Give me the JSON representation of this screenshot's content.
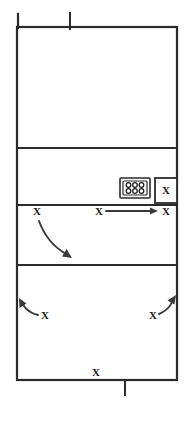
{
  "diagram": {
    "surface_color": "#ffffff",
    "line_color": "#2b2b2b",
    "arrow_color": "#3a3a3a",
    "player_marker_color": "#1a1a1a",
    "player_marker_symbol": "X",
    "net_post_top_label": "",
    "net_post_bottom_label": ""
  },
  "court": {
    "outer_boundary": {
      "x": 17,
      "y": 27,
      "width": 160,
      "height": 353
    },
    "zone_divider_lines_y": [
      148,
      205,
      265
    ],
    "zones": [
      {
        "name": "far-zone",
        "top": 27,
        "bottom": 148
      },
      {
        "name": "front-zone",
        "top": 148,
        "bottom": 205
      },
      {
        "name": "attack-zone",
        "top": 205,
        "bottom": 265
      },
      {
        "name": "back-zone",
        "top": 265,
        "bottom": 380
      }
    ],
    "net_post_top": {
      "x": 70,
      "y1": 12,
      "y2": 29
    },
    "net_post_bottom": {
      "x": 125,
      "y1": 379,
      "y2": 396
    },
    "left_sideline_overhang_top_y": 14
  },
  "equipment": {
    "ball_cart": {
      "label": "ball-cart",
      "x": 120,
      "y": 178,
      "width": 30,
      "height": 20,
      "ball_rows": 2,
      "ball_columns": 3,
      "ball_count": 6
    },
    "substitution_box": {
      "label": "substitution-box",
      "x": 155,
      "y": 178,
      "width": 22,
      "height": 25,
      "occupant_symbol": "X"
    }
  },
  "players": [
    {
      "id": "p-sub",
      "symbol": "X",
      "x": 166,
      "y": 191,
      "zone": "substitution-box"
    },
    {
      "id": "p-left-attack",
      "symbol": "X",
      "x": 37,
      "y": 212,
      "zone": "attack-zone"
    },
    {
      "id": "p-mid-attack",
      "symbol": "X",
      "x": 99,
      "y": 212,
      "zone": "attack-zone"
    },
    {
      "id": "p-right-attack",
      "symbol": "X",
      "x": 166,
      "y": 212,
      "zone": "attack-zone"
    },
    {
      "id": "p-back-left",
      "symbol": "X",
      "x": 45,
      "y": 316,
      "zone": "back-zone"
    },
    {
      "id": "p-back-right",
      "symbol": "X",
      "x": 153,
      "y": 316,
      "zone": "back-zone"
    },
    {
      "id": "p-baseline",
      "symbol": "X",
      "x": 96,
      "y": 373,
      "zone": "baseline"
    }
  ],
  "movements": [
    {
      "id": "m-straight-right",
      "type": "straight-arrow",
      "from": {
        "x": 106,
        "y": 211
      },
      "to": {
        "x": 158,
        "y": 211
      },
      "description": "straight pass right"
    },
    {
      "id": "m-curve-down-right",
      "type": "curved-arrow",
      "from": {
        "x": 39,
        "y": 221
      },
      "control": {
        "x": 46,
        "y": 244
      },
      "to": {
        "x": 70,
        "y": 257
      },
      "description": "curved run down-right"
    },
    {
      "id": "m-curve-up-left",
      "type": "curved-arrow",
      "from": {
        "x": 38,
        "y": 315
      },
      "control": {
        "x": 27,
        "y": 311
      },
      "to": {
        "x": 19,
        "y": 299
      },
      "description": "curved run up-left"
    },
    {
      "id": "m-curve-up-right",
      "type": "curved-arrow",
      "from": {
        "x": 159,
        "y": 314
      },
      "control": {
        "x": 169,
        "y": 308
      },
      "to": {
        "x": 175,
        "y": 296
      },
      "description": "curved run up-right"
    }
  ]
}
